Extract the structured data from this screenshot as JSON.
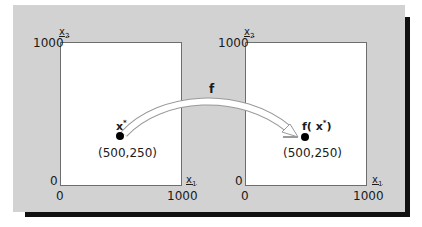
{
  "diagram": {
    "mapping_label": "f",
    "left_plot": {
      "y_axis_label": "x",
      "y_axis_sub": "2",
      "x_axis_label": "x",
      "x_axis_sub": "1",
      "y_max": "1000",
      "y_min": "0",
      "x_min": "0",
      "x_max": "1000",
      "point_label": "x",
      "point_sup": "*",
      "point_coords": "(500,250)"
    },
    "right_plot": {
      "y_axis_label": "x",
      "y_axis_sub": "2",
      "x_axis_label": "x",
      "x_axis_sub": "1",
      "y_max": "1000",
      "y_min": "0",
      "x_min": "0",
      "x_max": "1000",
      "point_label_prefix": "f( x",
      "point_sup": "*",
      "point_label_suffix": ")",
      "point_coords": "(500,250)"
    },
    "colors": {
      "panel": "#d2d2d2",
      "shadow": "#111111",
      "plot_bg": "#ffffff",
      "point": "#000000"
    }
  }
}
